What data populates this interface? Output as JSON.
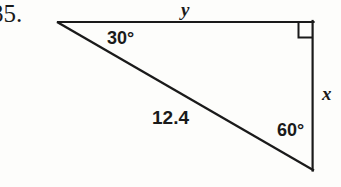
{
  "figure": {
    "problem_number": "35.",
    "background_color": "#fdfdfb",
    "stroke_color": "#1a1a1a",
    "shape": "right-triangle",
    "vertices": {
      "top_left": [
        58,
        22
      ],
      "top_right": [
        313,
        22
      ],
      "bottom_right": [
        313,
        170
      ]
    },
    "right_angle_marker": {
      "at_vertex": "top_right",
      "size": 14
    },
    "labels": {
      "angle_top_left": "30°",
      "angle_bottom_right": "60°",
      "hypotenuse": "12.4",
      "top_side": "y",
      "right_side": "x"
    }
  }
}
